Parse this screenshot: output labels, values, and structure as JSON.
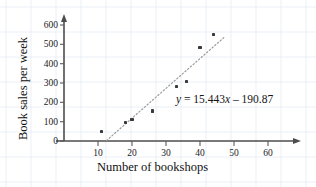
{
  "chart_data": {
    "type": "scatter",
    "title": "",
    "xlabel": "Number of bookshops",
    "ylabel": "Book sales per week",
    "xlim": [
      0,
      65
    ],
    "ylim": [
      0,
      640
    ],
    "xticks": [
      10,
      20,
      30,
      40,
      50,
      60
    ],
    "yticks": [
      0,
      100,
      200,
      300,
      400,
      500,
      600
    ],
    "xtick_labels": [
      "10",
      "20",
      "30",
      "40",
      "50",
      "60"
    ],
    "ytick_labels": [
      "0",
      "100",
      "200",
      "300",
      "400",
      "500",
      "600"
    ],
    "grid": "faint-blue-graph-paper",
    "legend": "none",
    "x": [
      11,
      18,
      20,
      26,
      33,
      36,
      40,
      44
    ],
    "y": [
      48,
      95,
      110,
      155,
      280,
      310,
      485,
      553
    ],
    "points": [
      {
        "x": 11,
        "y": 48
      },
      {
        "x": 18,
        "y": 95
      },
      {
        "x": 20,
        "y": 110
      },
      {
        "x": 26,
        "y": 155
      },
      {
        "x": 33,
        "y": 280
      },
      {
        "x": 36,
        "y": 310
      },
      {
        "x": 40,
        "y": 485
      },
      {
        "x": 44,
        "y": 553
      }
    ],
    "trendline": {
      "style": "dotted",
      "slope": 15.443,
      "intercept": -190.87,
      "x_start": 12.5,
      "x_end": 47.0,
      "equation_parts": {
        "y_var": "y",
        "equals": "=",
        "slope": "15.443",
        "x_var": "x",
        "minus": "–",
        "intercept": "190.87"
      },
      "equation_text": "y = 15.443x – 190.87"
    },
    "colors": {
      "point": "#3a3a3a",
      "axis": "#4d4d4d",
      "trendline": "#9a9a9a",
      "grid": "#dfe7f2",
      "text": "#111111",
      "background": "#ffffff"
    }
  }
}
